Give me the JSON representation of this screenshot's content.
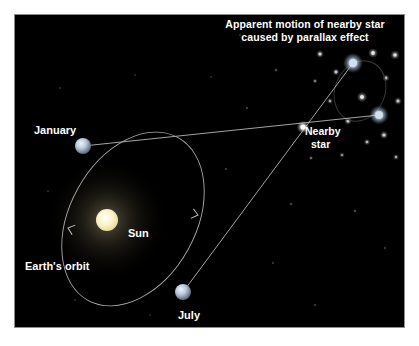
{
  "figure": {
    "kind": "astronomy-diagram",
    "background_color": "#000000",
    "page_color": "#ffffff",
    "border_color": "#8d8d8d",
    "text_color": "#ffffff"
  },
  "title": {
    "line1": "Apparent motion of nearby star",
    "line2": "caused by parallax effect"
  },
  "labels": {
    "january": "January",
    "july": "July",
    "sun": "Sun",
    "earths_orbit": "Earth's orbit",
    "nearby_star_line1": "Nearby",
    "nearby_star_line2": "star"
  },
  "objects": {
    "sun": {
      "name": "Sun",
      "x": 92,
      "y": 205,
      "radius": 11,
      "color": "#fdf4cf",
      "glow_color": "#4a4638",
      "glow_radius": 62
    },
    "earth_january": {
      "name": "Earth in January",
      "x": 68,
      "y": 131,
      "radius": 8,
      "color": "#c9d6e4"
    },
    "earth_july": {
      "name": "Earth in July",
      "x": 168,
      "y": 277,
      "radius": 8,
      "color": "#c9d6e4"
    },
    "nearby_star": {
      "name": "Nearby star",
      "x": 288,
      "y": 112,
      "radius": 2.6,
      "color": "#ffffff"
    },
    "apparent_position_upper": {
      "name": "Apparent position seen from July",
      "x": 338,
      "y": 48,
      "radius": 4.2,
      "color": "#cfe0f2"
    },
    "apparent_position_lower": {
      "name": "Apparent position seen from January",
      "x": 364,
      "y": 100,
      "radius": 4.0,
      "color": "#cfe0f2"
    }
  },
  "earth_orbit": {
    "center_x": 118,
    "center_y": 204,
    "radius_x": 63,
    "radius_y": 93,
    "rotation_deg": 29,
    "stroke": "#a9a9a9",
    "stroke_width": 0.9,
    "direction": "counterclockwise"
  },
  "apparent_path_ellipse": {
    "center_x": 345,
    "center_y": 76,
    "radius_x": 25,
    "radius_y": 31,
    "rotation_deg": 22,
    "stroke": "#3a3a3a",
    "stroke_width": 0.9
  },
  "sight_lines": [
    {
      "name": "january-to-lower-apparent-position",
      "x1": 68,
      "y1": 131,
      "x2": 364,
      "y2": 100
    },
    {
      "name": "july-to-upper-apparent-position",
      "x1": 168,
      "y1": 277,
      "x2": 338,
      "y2": 48
    }
  ],
  "orbit_arrows": [
    {
      "name": "orbit-arrow-left",
      "x": 53,
      "y": 213,
      "angle_deg": 108
    },
    {
      "name": "orbit-arrow-right",
      "x": 183,
      "y": 200,
      "angle_deg": -76
    }
  ],
  "starfield": [
    {
      "x": 305,
      "y": 39,
      "r": 1.5,
      "b": 0.75
    },
    {
      "x": 321,
      "y": 57,
      "r": 1.4,
      "b": 0.7
    },
    {
      "x": 315,
      "y": 86,
      "r": 1.2,
      "b": 0.55
    },
    {
      "x": 333,
      "y": 106,
      "r": 1.5,
      "b": 0.7
    },
    {
      "x": 347,
      "y": 82,
      "r": 2.0,
      "b": 0.85
    },
    {
      "x": 358,
      "y": 38,
      "r": 1.9,
      "b": 0.85
    },
    {
      "x": 371,
      "y": 63,
      "r": 1.4,
      "b": 0.65
    },
    {
      "x": 380,
      "y": 40,
      "r": 1.8,
      "b": 0.8
    },
    {
      "x": 369,
      "y": 120,
      "r": 1.6,
      "b": 0.72
    },
    {
      "x": 352,
      "y": 127,
      "r": 1.3,
      "b": 0.6
    },
    {
      "x": 383,
      "y": 86,
      "r": 1.5,
      "b": 0.68
    },
    {
      "x": 381,
      "y": 142,
      "r": 1.2,
      "b": 0.55
    },
    {
      "x": 327,
      "y": 140,
      "r": 1.1,
      "b": 0.5
    },
    {
      "x": 300,
      "y": 66,
      "r": 1.0,
      "b": 0.45
    },
    {
      "x": 296,
      "y": 143,
      "r": 0.9,
      "b": 0.4
    },
    {
      "x": 261,
      "y": 55,
      "r": 0.8,
      "b": 0.35
    },
    {
      "x": 232,
      "y": 93,
      "r": 0.7,
      "b": 0.3
    },
    {
      "x": 211,
      "y": 154,
      "r": 0.7,
      "b": 0.28
    },
    {
      "x": 276,
      "y": 189,
      "r": 0.8,
      "b": 0.3
    },
    {
      "x": 340,
      "y": 196,
      "r": 0.8,
      "b": 0.32
    },
    {
      "x": 370,
      "y": 233,
      "r": 0.7,
      "b": 0.28
    },
    {
      "x": 258,
      "y": 248,
      "r": 0.7,
      "b": 0.26
    },
    {
      "x": 196,
      "y": 62,
      "r": 0.6,
      "b": 0.24
    },
    {
      "x": 120,
      "y": 60,
      "r": 0.6,
      "b": 0.22
    },
    {
      "x": 45,
      "y": 73,
      "r": 0.6,
      "b": 0.22
    },
    {
      "x": 33,
      "y": 176,
      "r": 0.6,
      "b": 0.22
    },
    {
      "x": 60,
      "y": 285,
      "r": 0.6,
      "b": 0.22
    },
    {
      "x": 135,
      "y": 300,
      "r": 0.6,
      "b": 0.2
    },
    {
      "x": 300,
      "y": 290,
      "r": 0.7,
      "b": 0.26
    },
    {
      "x": 225,
      "y": 20,
      "r": 0.6,
      "b": 0.22
    }
  ]
}
